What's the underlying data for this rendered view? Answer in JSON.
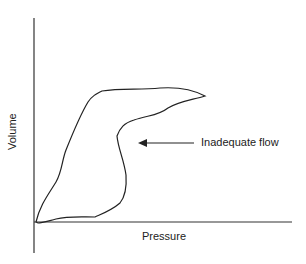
{
  "diagram": {
    "type": "pressure-volume loop",
    "x_axis_label": "Pressure",
    "y_axis_label": "Volume",
    "annotation": "Inadequate flow",
    "line_color": "#222222"
  }
}
